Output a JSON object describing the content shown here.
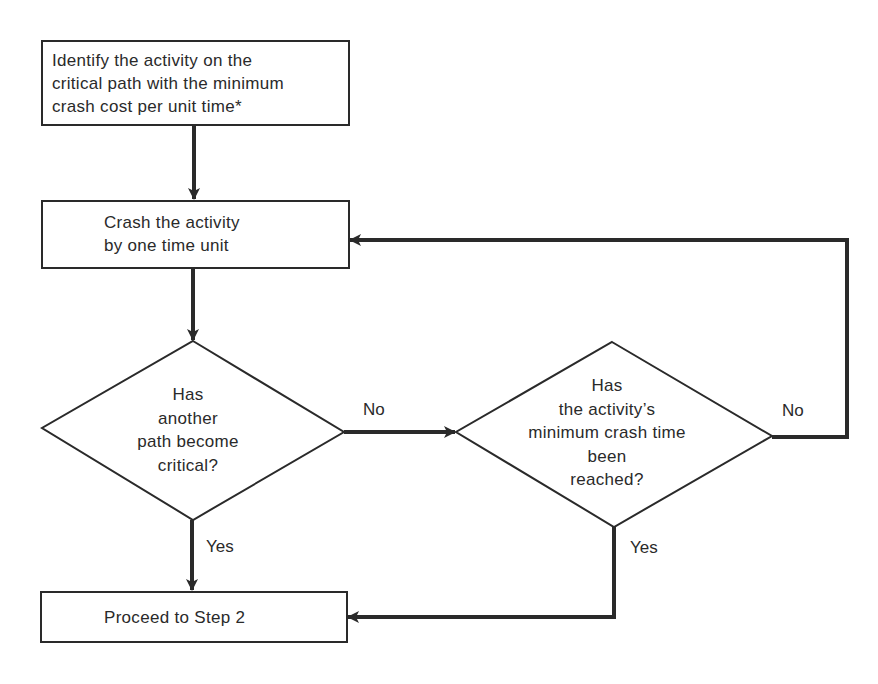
{
  "diagram": {
    "type": "flowchart",
    "nodes": [
      {
        "id": "identify",
        "shape": "rectangle",
        "lines": [
          "Identify the activity on the",
          "critical path with the minimum",
          "crash cost per unit time*"
        ]
      },
      {
        "id": "crash",
        "shape": "rectangle",
        "lines": [
          "Crash the activity",
          "by one time unit"
        ]
      },
      {
        "id": "decision_critical",
        "shape": "diamond",
        "lines": [
          "Has",
          "another",
          "path become",
          "critical?"
        ]
      },
      {
        "id": "decision_min_time",
        "shape": "diamond",
        "lines": [
          "Has",
          "the activity’s",
          "minimum crash time",
          "been",
          "reached?"
        ]
      },
      {
        "id": "proceed",
        "shape": "rectangle",
        "lines": [
          "Proceed to Step 2"
        ]
      }
    ],
    "edges": [
      {
        "from": "identify",
        "to": "crash",
        "label": ""
      },
      {
        "from": "crash",
        "to": "decision_critical",
        "label": ""
      },
      {
        "from": "decision_critical",
        "to": "decision_min_time",
        "label": "No"
      },
      {
        "from": "decision_critical",
        "to": "proceed",
        "label": "Yes"
      },
      {
        "from": "decision_min_time",
        "to": "crash",
        "label": "No"
      },
      {
        "from": "decision_min_time",
        "to": "proceed",
        "label": "Yes"
      }
    ],
    "labels": {
      "no_critical": "No",
      "yes_critical": "Yes",
      "no_min_time": "No",
      "yes_min_time": "Yes"
    },
    "colors": {
      "line": "#2a2a2a",
      "background": "#ffffff"
    }
  }
}
